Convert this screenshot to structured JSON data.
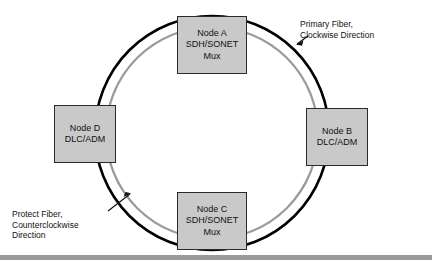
{
  "diagram": {
    "type": "network-ring-diagram",
    "colors": {
      "node_fill": "#c9c9c9",
      "node_border": "#2a2a2a",
      "primary_fiber": "#000000",
      "protect_fiber": "#9a9a9a",
      "background": "#ffffff",
      "bottom_bar": "#9a9a9a",
      "text": "#111111"
    },
    "nodes": [
      {
        "id": "node-a",
        "position": "top",
        "lines": [
          "Node A",
          "SDH/SONET",
          "Mux"
        ]
      },
      {
        "id": "node-b",
        "position": "right",
        "lines": [
          "Node B",
          "DLC/ADM"
        ]
      },
      {
        "id": "node-c",
        "position": "bottom",
        "lines": [
          "Node C",
          "SDH/SONET",
          "Mux"
        ]
      },
      {
        "id": "node-d",
        "position": "left",
        "lines": [
          "Node D",
          "DLC/ADM"
        ]
      }
    ],
    "annotations": [
      {
        "id": "primary-fiber",
        "lines": [
          "Primary Fiber,",
          "Clockwise Direction"
        ],
        "points_to": "outer-black-ring"
      },
      {
        "id": "protect-fiber",
        "lines": [
          "Protect Fiber,",
          "Counterclockwise",
          "Direction"
        ],
        "points_to": "inner-gray-ring"
      }
    ],
    "rings": [
      {
        "id": "primary-ring",
        "label": "Primary Fiber",
        "style": "outer-black-solid"
      },
      {
        "id": "protect-ring",
        "label": "Protect Fiber",
        "style": "inner-gray-solid"
      }
    ]
  }
}
